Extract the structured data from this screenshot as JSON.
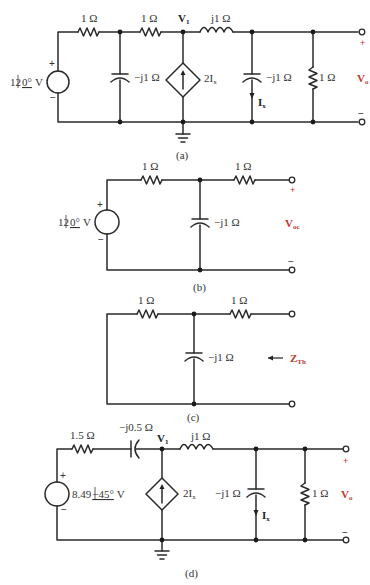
{
  "figure_number_partial": "",
  "colors": {
    "wire": "#2a2a2a",
    "accent_label": "#c0392b"
  },
  "panel_a": {
    "caption": "(a)",
    "source": {
      "value": "12",
      "angle": "0°",
      "unit": "V",
      "plus": "+",
      "minus": "−"
    },
    "r1": "1 Ω",
    "c1": "−j1 Ω",
    "r2": "1 Ω",
    "node_label": "V",
    "node_sub": "1",
    "dep_source": "2I",
    "dep_sub": "x",
    "inductor": "j1 Ω",
    "c2": "−j1 Ω",
    "current": "I",
    "current_sub": "x",
    "r_load": "1 Ω",
    "out_plus": "+",
    "out_minus": "−",
    "out_label": "V",
    "out_sub": "o"
  },
  "panel_b": {
    "caption": "(b)",
    "source": {
      "value": "12",
      "angle": "0°",
      "unit": "V",
      "plus": "+",
      "minus": "−"
    },
    "r1": "1 Ω",
    "c1": "−j1 Ω",
    "r2": "1 Ω",
    "out_plus": "+",
    "out_minus": "−",
    "out_label": "V",
    "out_sub": "oc"
  },
  "panel_c": {
    "caption": "(c)",
    "r1": "1 Ω",
    "c1": "−j1 Ω",
    "r2": "1 Ω",
    "arrow": "←",
    "z_label": "Z",
    "z_sub": "Th"
  },
  "panel_d": {
    "caption": "(d)",
    "source": {
      "value": "8.49",
      "angle": "−45°",
      "unit": "V",
      "plus": "+",
      "minus": "−"
    },
    "r1": "1.5 Ω",
    "c_series": "−j0.5 Ω",
    "node_label": "V",
    "node_sub": "1",
    "dep_source": "2I",
    "dep_sub": "x",
    "inductor": "j1 Ω",
    "c2": "−j1 Ω",
    "current": "I",
    "current_sub": "x",
    "r_load": "1 Ω",
    "out_plus": "+",
    "out_minus": "−",
    "out_label": "V",
    "out_sub": "o"
  }
}
